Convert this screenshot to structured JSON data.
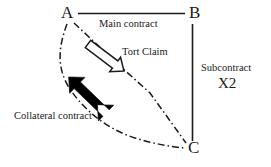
{
  "diagram": {
    "background_color": "#ffffff",
    "ink_color": "#1a1a1a",
    "nodes": [
      {
        "id": "A",
        "label": "A",
        "x": 68,
        "y": 13
      },
      {
        "id": "B",
        "label": "B",
        "x": 195,
        "y": 13
      },
      {
        "id": "C",
        "label": "C",
        "x": 194,
        "y": 148
      }
    ],
    "edges": [
      {
        "id": "main-contract",
        "label": "Main contract",
        "from": "A",
        "to": "B",
        "style": "solid",
        "arrow": "none",
        "color": "#1a1a1a"
      },
      {
        "id": "subcontract",
        "label": "Subcontract",
        "sublabel": "X2",
        "from": "B",
        "to": "C",
        "style": "solid",
        "arrow": "none",
        "color": "#1a1a1a"
      },
      {
        "id": "tort-claim",
        "label": "Tort Claim",
        "from": "A",
        "to": "C",
        "style": "hollow-block-arrow",
        "arrow": "single",
        "color": "#1a1a1a"
      },
      {
        "id": "collateral-contract",
        "label": "Collateral contract",
        "from": "A",
        "to": "C",
        "style": "solid-block-arrow",
        "arrow": "double",
        "color": "#000000"
      },
      {
        "id": "curve-a-c",
        "label": "",
        "from": "A",
        "to": "C",
        "style": "dash-dot",
        "arrow": "none",
        "color": "#1a1a1a"
      },
      {
        "id": "dash-dot-tort-path",
        "label": "",
        "from": "A",
        "to": "C",
        "style": "dash-dot",
        "arrow": "none",
        "color": "#1a1a1a"
      }
    ]
  }
}
